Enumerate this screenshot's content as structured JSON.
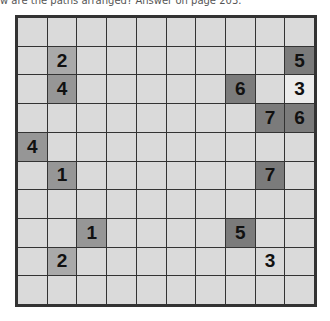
{
  "caption": "w are the paths arranged? Answer on page 203.",
  "puzzle": {
    "rows": 10,
    "cols": 10,
    "colors": {
      "cell": "#dadada",
      "grid_line": "#333333",
      "shade_light": "#a9a9a9",
      "shade_mid": "#969696",
      "shade_dark": "#7b7b7b",
      "shade_white": "#ececec"
    },
    "clues": [
      {
        "row": 1,
        "col": 1,
        "value": "2",
        "shade": "light"
      },
      {
        "row": 1,
        "col": 9,
        "value": "5",
        "shade": "dark"
      },
      {
        "row": 2,
        "col": 1,
        "value": "4",
        "shade": "mid"
      },
      {
        "row": 2,
        "col": 7,
        "value": "6",
        "shade": "dark"
      },
      {
        "row": 2,
        "col": 9,
        "value": "3",
        "shade": "white"
      },
      {
        "row": 3,
        "col": 8,
        "value": "7",
        "shade": "dark"
      },
      {
        "row": 3,
        "col": 9,
        "value": "6",
        "shade": "dark"
      },
      {
        "row": 4,
        "col": 0,
        "value": "4",
        "shade": "mid"
      },
      {
        "row": 5,
        "col": 1,
        "value": "1",
        "shade": "mid"
      },
      {
        "row": 5,
        "col": 8,
        "value": "7",
        "shade": "dark"
      },
      {
        "row": 7,
        "col": 2,
        "value": "1",
        "shade": "mid"
      },
      {
        "row": 7,
        "col": 7,
        "value": "5",
        "shade": "dark"
      },
      {
        "row": 8,
        "col": 1,
        "value": "2",
        "shade": "light"
      },
      {
        "row": 8,
        "col": 8,
        "value": "3",
        "shade": "none"
      }
    ]
  }
}
